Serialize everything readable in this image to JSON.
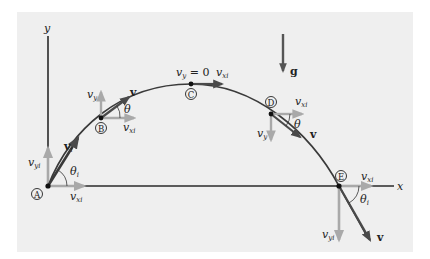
{
  "diagram": {
    "colors": {
      "background": "#ffffff",
      "panel": "#efefef",
      "trajectory": "#3a3a3a",
      "axis": "#2a2a2a",
      "component_arrow": "#a9a9a9",
      "velocity_arrow": "#4a4a4a",
      "gravity_arrow": "#555555",
      "text": "#222222"
    },
    "axes": {
      "x_label": "x",
      "y_label": "y"
    },
    "gravity": {
      "label": "g"
    },
    "points": [
      {
        "id": "A",
        "marker": "A",
        "labels": {
          "v": "v",
          "v_sub": "i",
          "vy": "v",
          "vy_sub": "yi",
          "vx": "v",
          "vx_sub": "xi",
          "theta": "θ",
          "theta_sub": "i"
        }
      },
      {
        "id": "B",
        "marker": "B",
        "labels": {
          "v": "v",
          "vy": "v",
          "vy_sub": "y",
          "vx": "v",
          "vx_sub": "xi",
          "theta": "θ"
        }
      },
      {
        "id": "C",
        "marker": "C",
        "labels": {
          "vy_eq": "v",
          "vy_eq_sub": "y",
          "vy_eq_rest": " = 0",
          "vx": "v",
          "vx_sub": "xi"
        }
      },
      {
        "id": "D",
        "marker": "D",
        "labels": {
          "v": "v",
          "vy": "v",
          "vy_sub": "y",
          "vx": "v",
          "vx_sub": "xi",
          "theta": "θ"
        }
      },
      {
        "id": "E",
        "marker": "E",
        "labels": {
          "v": "v",
          "vy": "v",
          "vy_sub": "yi",
          "vx": "v",
          "vx_sub": "xi",
          "theta": "θ",
          "theta_sub": "i"
        }
      }
    ]
  }
}
